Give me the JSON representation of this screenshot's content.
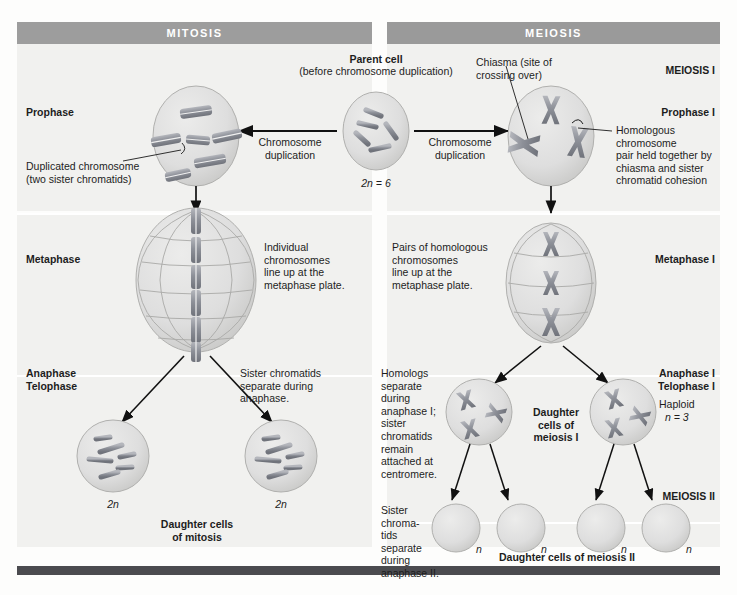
{
  "diagram": {
    "columns": [
      {
        "id": "mitosis",
        "header": "MITOSIS"
      },
      {
        "id": "meiosis",
        "header": "MEIOSIS"
      }
    ]
  },
  "parent": {
    "title": "Parent cell",
    "subtitle": "(before chromosome duplication)",
    "ploidy": "2n = 6",
    "chromosome_count": 6
  },
  "arrows": {
    "left_label": "Chromosome\nduplication",
    "right_label": "Chromosome\nduplication"
  },
  "mitosis": {
    "stage1_label": "Prophase",
    "stage1_callout": "Duplicated chromosome\n(two sister chromatids)",
    "stage2_label": "Metaphase",
    "stage2_note": "Individual\nchromosomes\nline up at the\nmetaphase plate.",
    "stage3_label": "Anaphase\nTelophase",
    "stage3_note": "Sister chromatids\nseparate during\nanaphase.",
    "daughter_ploidy_left": "2n",
    "daughter_ploidy_right": "2n",
    "daughter_caption": "Daughter cells\nof mitosis",
    "prophase_chromosomes": 6,
    "metaphase_chromosomes": 6,
    "daughter_chromosomes": 6
  },
  "meiosis": {
    "section1_label": "MEIOSIS I",
    "section2_label": "MEIOSIS II",
    "chiasma_callout": "Chiasma (site of\ncrossing over)",
    "homolog_callout": "Homologous\nchromosome\npair held together by\nchiasma and sister\nchromatid cohesion",
    "stage1_label": "Prophase I",
    "stage2_label": "Metaphase I",
    "stage2_note": "Pairs of homologous\nchromosomes\nline up at the\nmetaphase plate.",
    "stage3_label": "Anaphase I\nTelophase I",
    "stage3_note": "Homologs\nseparate\nduring\nanaphase I;\nsister\nchromatids\nremain\nattached at\ncentromere.",
    "haploid_label": "Haploid",
    "haploid_ploidy": "n = 3",
    "daughter1_caption": "Daughter\ncells of\nmeiosis I",
    "stage4_note": "Sister\nchroma-\ntids\nseparate\nduring\nanaphase II.",
    "daughter2_caption": "Daughter cells of meiosis II",
    "daughter2_ploidy": "n",
    "prophase1_tetrads": 3,
    "metaphase1_tetrads": 3,
    "meiosis1_daughter_chromosomes": 3,
    "meiosis2_daughter_chromosomes": 3,
    "meiosis2_daughter_cells": 4
  },
  "colors": {
    "header_band": "#9d9d9d",
    "panel_bg": "#f1f1ef",
    "page_bg": "#fdfdfc",
    "cell_fill": "#dcdcd8",
    "chromosome": "#8e9097",
    "text": "#1d1d1d",
    "foot_rule": "#4b4b4f"
  }
}
